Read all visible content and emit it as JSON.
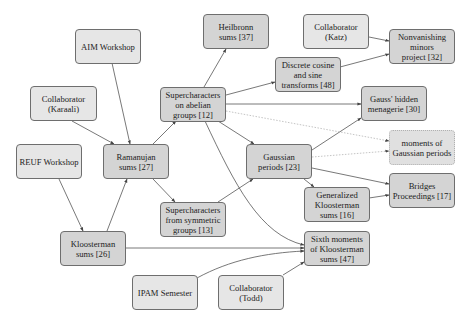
{
  "diagram": {
    "type": "citation-dependency-graph",
    "colors": {
      "source_fill": "#e6e6e6",
      "paper_fill": "#d4d4d4",
      "wip_fill": "#e0e0e0",
      "border": "#6e6e6e",
      "edge": "#555555",
      "dotted_edge": "#b5b5b5"
    },
    "nodes": [
      {
        "id": "aim",
        "label": "AIM Workshop",
        "kind": "source"
      },
      {
        "id": "heilbronn",
        "label": "Heilbronn\nsums [37]",
        "kind": "paper"
      },
      {
        "id": "katz",
        "label": "Collaborator\n(Katz)",
        "kind": "source"
      },
      {
        "id": "nonvanishing",
        "label": "Nonvanishing\nminors\nproject [32]",
        "kind": "paper"
      },
      {
        "id": "dct",
        "label": "Discrete cosine\nand sine\ntransforms [48]",
        "kind": "paper"
      },
      {
        "id": "karaali",
        "label": "Collaborator\n(Karaali)",
        "kind": "source"
      },
      {
        "id": "superab",
        "label": "Supercharacters\non abelian\ngroups [12]",
        "kind": "paper"
      },
      {
        "id": "menagerie",
        "label": "Gauss' hidden\nmenagerie [30]",
        "kind": "paper"
      },
      {
        "id": "moments",
        "label": "moments of\nGaussian periods",
        "kind": "wip"
      },
      {
        "id": "reuf",
        "label": "REUF Workshop",
        "kind": "source"
      },
      {
        "id": "ramanujan",
        "label": "Ramanujan\nsums [27]",
        "kind": "paper"
      },
      {
        "id": "gaussian",
        "label": "Gaussian\nperiods [23]",
        "kind": "paper"
      },
      {
        "id": "bridges",
        "label": "Bridges\nProceedings [17]",
        "kind": "paper"
      },
      {
        "id": "genkloost",
        "label": "Generalized\nKloosterman\nsums [16]",
        "kind": "paper"
      },
      {
        "id": "supersym",
        "label": "Supercharacters\nfrom symmetric\ngroups [13]",
        "kind": "paper"
      },
      {
        "id": "kloost",
        "label": "Kloosterman\nsums [26]",
        "kind": "paper"
      },
      {
        "id": "sixth",
        "label": "Sixth moments\nof Kloosterman\nsums [47]",
        "kind": "paper"
      },
      {
        "id": "ipam",
        "label": "IPAM Semester",
        "kind": "source"
      },
      {
        "id": "todd",
        "label": "Collaborator\n(Todd)",
        "kind": "source"
      }
    ],
    "edges": [
      {
        "from": "aim",
        "to": "ramanujan",
        "style": "solid"
      },
      {
        "from": "karaali",
        "to": "ramanujan",
        "style": "solid"
      },
      {
        "from": "reuf",
        "to": "kloost",
        "style": "solid"
      },
      {
        "from": "kloost",
        "to": "ramanujan",
        "style": "solid"
      },
      {
        "from": "ramanujan",
        "to": "superab",
        "style": "solid"
      },
      {
        "from": "ramanujan",
        "to": "supersym",
        "style": "solid"
      },
      {
        "from": "superab",
        "to": "heilbronn",
        "style": "solid"
      },
      {
        "from": "superab",
        "to": "dct",
        "style": "solid"
      },
      {
        "from": "superab",
        "to": "menagerie",
        "style": "solid"
      },
      {
        "from": "superab",
        "to": "moments",
        "style": "dotted"
      },
      {
        "from": "superab",
        "to": "gaussian",
        "style": "solid"
      },
      {
        "from": "superab",
        "to": "sixth",
        "style": "solid"
      },
      {
        "from": "katz",
        "to": "nonvanishing",
        "style": "solid"
      },
      {
        "from": "dct",
        "to": "nonvanishing",
        "style": "solid"
      },
      {
        "from": "supersym",
        "to": "gaussian",
        "style": "solid"
      },
      {
        "from": "gaussian",
        "to": "menagerie",
        "style": "solid"
      },
      {
        "from": "gaussian",
        "to": "moments",
        "style": "dotted"
      },
      {
        "from": "gaussian",
        "to": "bridges",
        "style": "solid"
      },
      {
        "from": "gaussian",
        "to": "genkloost",
        "style": "solid"
      },
      {
        "from": "genkloost",
        "to": "bridges",
        "style": "solid"
      },
      {
        "from": "kloost",
        "to": "sixth",
        "style": "solid"
      },
      {
        "from": "ipam",
        "to": "sixth",
        "style": "solid"
      },
      {
        "from": "todd",
        "to": "sixth",
        "style": "solid"
      }
    ]
  }
}
